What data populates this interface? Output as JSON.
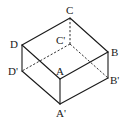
{
  "diagram": {
    "type": "cuboid",
    "vertices": {
      "A": {
        "label": "A",
        "x": 60,
        "y": 79
      },
      "B": {
        "label": "B",
        "x": 108,
        "y": 52
      },
      "C": {
        "label": "C",
        "x": 70,
        "y": 18
      },
      "D": {
        "label": "D",
        "x": 22,
        "y": 45
      },
      "A'": {
        "label": "A'",
        "x": 60,
        "y": 104
      },
      "B'": {
        "label": "B'",
        "x": 108,
        "y": 78
      },
      "C'": {
        "label": "C'",
        "x": 70,
        "y": 44
      },
      "D'": {
        "label": "D'",
        "x": 22,
        "y": 71
      }
    },
    "labels": {
      "A": "A",
      "B": "B",
      "C": "C",
      "D": "D",
      "A_prime": "A'",
      "B_prime": "B'",
      "C_prime": "C'",
      "D_prime": "D'"
    },
    "solid_edges": [
      [
        "A",
        "B"
      ],
      [
        "B",
        "C"
      ],
      [
        "C",
        "D"
      ],
      [
        "D",
        "A"
      ],
      [
        "A",
        "A'"
      ],
      [
        "B",
        "B'"
      ],
      [
        "D",
        "D'"
      ],
      [
        "A'",
        "B'"
      ],
      [
        "A'",
        "D'"
      ]
    ],
    "dashed_edges": [
      [
        "C",
        "C'"
      ],
      [
        "C'",
        "B'"
      ],
      [
        "C'",
        "D'"
      ]
    ]
  }
}
